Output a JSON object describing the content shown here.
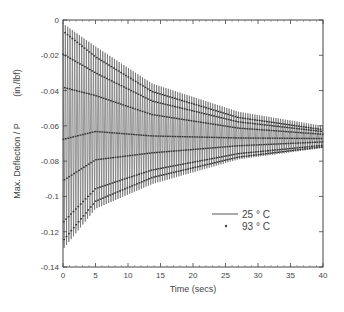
{
  "chart_data": {
    "type": "line",
    "title": "",
    "xlabel": "Time (secs)",
    "ylabel": "Max. Deflection / P",
    "ylabel_units": "(in./lbf)",
    "xlim": [
      0,
      40
    ],
    "ylim": [
      -0.14,
      0
    ],
    "xticks": [
      0,
      5,
      10,
      15,
      20,
      25,
      30,
      35,
      40
    ],
    "yticks": [
      0,
      -0.02,
      -0.04,
      -0.06,
      -0.08,
      -0.1,
      -0.12,
      -0.14
    ],
    "ytick_labels": [
      "0",
      "-0.02",
      "-0.04",
      "-0.06",
      "-0.08",
      "-0.1",
      "-0.12",
      "-0.14"
    ],
    "grid": false,
    "legend_position": "lower right",
    "oscillation_period_secs": 0.36,
    "series": [
      {
        "name": "25 ° C",
        "style": "solid line",
        "envelope": {
          "t": [
            0,
            5,
            13.7,
            27,
            40
          ],
          "upper": [
            -0.002,
            -0.015,
            -0.036,
            -0.052,
            -0.06
          ],
          "lower": [
            -0.13,
            -0.107,
            -0.093,
            -0.079,
            -0.0725
          ]
        }
      },
      {
        "name": "93 ° C",
        "style": "dots",
        "envelope": {
          "t": [
            0,
            5,
            13.7,
            27,
            40
          ],
          "upper": [
            -0.005,
            -0.02,
            -0.04,
            -0.055,
            -0.062
          ],
          "lower": [
            -0.127,
            -0.104,
            -0.09,
            -0.078,
            -0.072
          ]
        }
      }
    ]
  },
  "legend": {
    "items": [
      {
        "label": "25 ° C",
        "marker": "line"
      },
      {
        "label": "93 ° C",
        "marker": "dot"
      }
    ]
  }
}
